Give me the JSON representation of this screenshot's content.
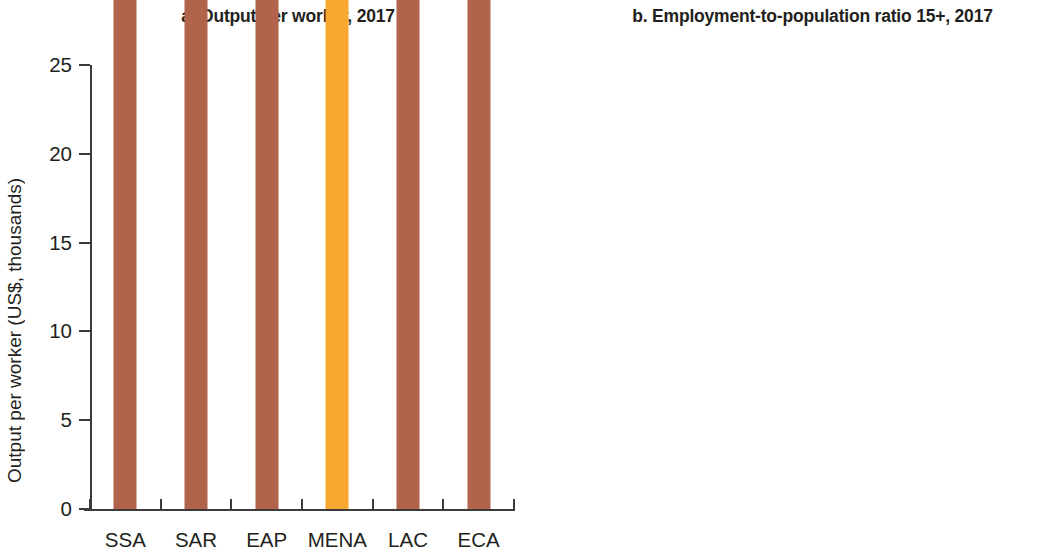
{
  "figure": {
    "background": "#ffffff",
    "colors": {
      "bar_default": "#b1644b",
      "bar_highlight": "#f6a831",
      "axis": "#3b3b3b",
      "text": "#231f20"
    }
  },
  "panels": [
    {
      "key": "a",
      "title": "a. Output per worker, 2017",
      "ylabel": "Output per worker (US$, thousands)",
      "yticks": [
        "0",
        "5",
        "10",
        "15",
        "20",
        "25"
      ],
      "categories": [
        "SSA",
        "SAR",
        "EAP",
        "MENA",
        "LAC",
        "ECA"
      ],
      "labels": [
        "4,374",
        "4,735",
        "11,719",
        "15,812",
        "18,684",
        "19,219"
      ]
    },
    {
      "key": "b",
      "title": "b. Employment-to-population ratio 15+, 2017",
      "ylabel": "Ratio (%)",
      "yticks": [
        "0",
        "10",
        "20",
        "30",
        "40",
        "50",
        "60",
        "70"
      ],
      "categories": [
        "MENA",
        "SAR",
        "ECA",
        "LAC",
        "SSA",
        "EAP"
      ],
      "labels": [
        "39.0",
        "48.9",
        "54.7",
        "58.9",
        "62.8",
        "65.9"
      ]
    }
  ],
  "chart_data": [
    {
      "type": "bar",
      "panel": "a",
      "title": "a. Output per worker, 2017",
      "xlabel": "",
      "ylabel": "Output per worker (US$, thousands)",
      "ylim": [
        0,
        25
      ],
      "ytick_values": [
        0,
        5,
        10,
        15,
        20,
        25
      ],
      "grid": false,
      "legend": "none",
      "categories": [
        "SSA",
        "SAR",
        "EAP",
        "MENA",
        "LAC",
        "ECA"
      ],
      "values": [
        4374,
        4735,
        11719,
        15812,
        18684,
        19219
      ],
      "value_labels": [
        "4,374",
        "4,735",
        "11,719",
        "15,812",
        "18,684",
        "19,219"
      ],
      "value_scale": "units of US$ plotted on a thousands axis",
      "bar_colors": [
        "#b1644b",
        "#b1644b",
        "#b1644b",
        "#f6a831",
        "#b1644b",
        "#b1644b"
      ],
      "highlighted_category": "MENA"
    },
    {
      "type": "bar",
      "panel": "b",
      "title": "b. Employment-to-population ratio 15+, 2017",
      "xlabel": "",
      "ylabel": "Ratio (%)",
      "ylim": [
        0,
        70
      ],
      "ytick_values": [
        0,
        10,
        20,
        30,
        40,
        50,
        60,
        70
      ],
      "grid": false,
      "legend": "none",
      "categories": [
        "MENA",
        "SAR",
        "ECA",
        "LAC",
        "SSA",
        "EAP"
      ],
      "values": [
        39.0,
        48.9,
        54.7,
        58.9,
        62.8,
        65.9
      ],
      "value_labels": [
        "39.0",
        "48.9",
        "54.7",
        "58.9",
        "62.8",
        "65.9"
      ],
      "bar_colors": [
        "#f6a831",
        "#b1644b",
        "#b1644b",
        "#b1644b",
        "#b1644b",
        "#b1644b"
      ],
      "highlighted_category": "MENA"
    }
  ]
}
